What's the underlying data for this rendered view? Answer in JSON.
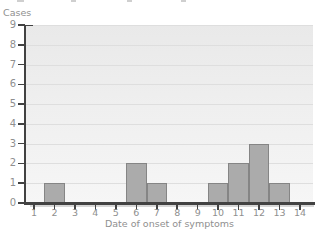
{
  "chart_data": {
    "type": "bar",
    "title": "",
    "ylabel": "Cases",
    "xlabel": "Date of onset of symptoms",
    "categories": [
      "1",
      "2",
      "3",
      "4",
      "5",
      "6",
      "7",
      "8",
      "9",
      "10",
      "11",
      "12",
      "13",
      "14"
    ],
    "values": [
      0,
      1,
      0,
      0,
      0,
      2,
      1,
      0,
      0,
      1,
      2,
      3,
      1,
      0
    ],
    "yticks": [
      0,
      1,
      2,
      3,
      4,
      5,
      6,
      7,
      8,
      9
    ],
    "ylim": [
      0,
      9
    ],
    "grid": "horizontal",
    "legend": "none",
    "total_cases": 11
  },
  "colors": {
    "bar_fill": "#ababab",
    "bar_border": "#858585",
    "plot_bg_top": "#e9e9e9",
    "plot_bg_bottom": "#f6f6f6",
    "gridline": "#dedede",
    "axis": "#424242",
    "axis_shadow": "#d6d6d6",
    "label_text": "#8f8f8f",
    "background": "#ffffff"
  }
}
